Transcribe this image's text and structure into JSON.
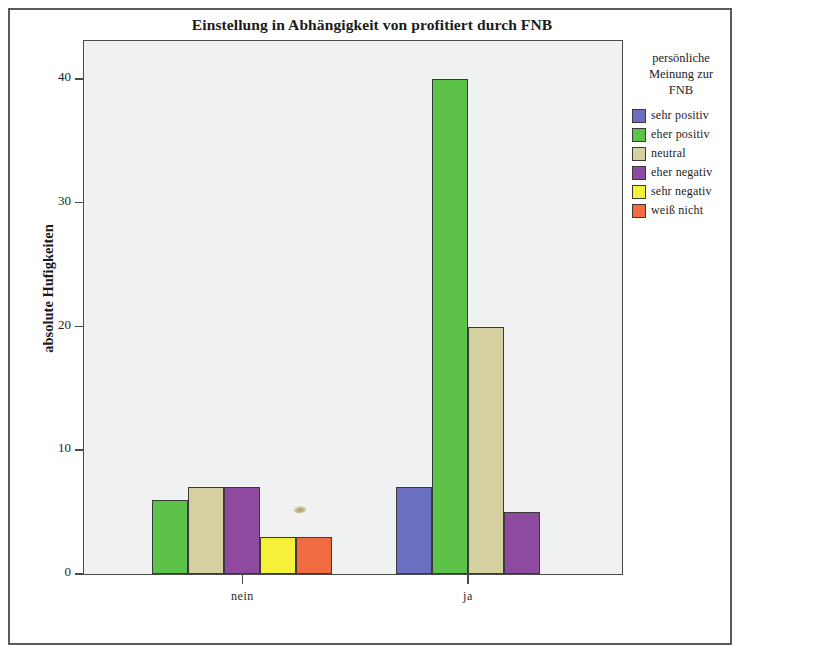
{
  "figure": {
    "title": "Einstellung in Abhängigkeit von profitiert durch FNB",
    "y_axis_title": "absolute Hufigkeiten",
    "plot_background": "#f0f2f2",
    "frame_color": "#5b5b5b"
  },
  "legend": {
    "title_lines": [
      "persönliche",
      "Meinung zur",
      "FNB"
    ],
    "title": "persönliche Meinung zur FNB",
    "items": [
      {
        "label": "sehr positiv",
        "color": "#6b6fc0"
      },
      {
        "label": "eher positiv",
        "color": "#5cc24a"
      },
      {
        "label": "neutral",
        "color": "#d5d0a0"
      },
      {
        "label": "eher negativ",
        "color": "#8e4a9e"
      },
      {
        "label": "sehr negativ",
        "color": "#f5f13a"
      },
      {
        "label": "weiß nicht",
        "color": "#f06a42"
      }
    ]
  },
  "chart_data": {
    "type": "bar",
    "title": "Einstellung in Abhängigkeit von profitiert durch FNB",
    "xlabel": "",
    "ylabel": "absolute Hufigkeiten",
    "ylim": [
      0,
      43
    ],
    "yticks": [
      0,
      10,
      20,
      30,
      40
    ],
    "ytick_labels": [
      "0",
      "10",
      "20",
      "30",
      "40"
    ],
    "grid": false,
    "legend_position": "right",
    "legend_title": "persönliche Meinung zur FNB",
    "categories": [
      "nein",
      "ja"
    ],
    "series": [
      {
        "name": "sehr positiv",
        "color": "#6b6fc0",
        "values": [
          0,
          7
        ]
      },
      {
        "name": "eher positiv",
        "color": "#5cc24a",
        "values": [
          6,
          40
        ]
      },
      {
        "name": "neutral",
        "color": "#d5d0a0",
        "values": [
          7,
          20
        ]
      },
      {
        "name": "eher negativ",
        "color": "#8e4a9e",
        "values": [
          7,
          5
        ]
      },
      {
        "name": "sehr negativ",
        "color": "#f5f13a",
        "values": [
          3,
          0
        ]
      },
      {
        "name": "weiß nicht",
        "color": "#f06a42",
        "values": [
          3,
          0
        ]
      }
    ]
  }
}
